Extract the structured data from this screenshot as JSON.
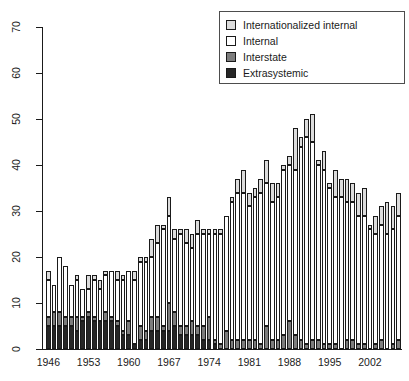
{
  "chart_data": {
    "type": "bar",
    "subtype": "stacked-bar",
    "title": "",
    "subtitle": "",
    "xlabel": "",
    "ylabel": "",
    "xlim": [
      1946,
      2007
    ],
    "ylim": [
      0,
      70
    ],
    "ytick_step": 10,
    "ytick_labels": [
      "0",
      "10",
      "20",
      "30",
      "40",
      "50",
      "60",
      "70"
    ],
    "ytick_values": [
      0,
      10,
      20,
      30,
      40,
      50,
      60,
      70
    ],
    "xtick_labels": [
      "1946",
      "1953",
      "1960",
      "1967",
      "1974",
      "1981",
      "1988",
      "1995",
      "2002"
    ],
    "xtick_values": [
      1946,
      1953,
      1960,
      1967,
      1974,
      1981,
      1988,
      1995,
      2002
    ],
    "grid": false,
    "legend_position": "top-right",
    "categories": [
      1946,
      1947,
      1948,
      1949,
      1950,
      1951,
      1952,
      1953,
      1954,
      1955,
      1956,
      1957,
      1958,
      1959,
      1960,
      1961,
      1962,
      1963,
      1964,
      1965,
      1966,
      1967,
      1968,
      1969,
      1970,
      1971,
      1972,
      1973,
      1974,
      1975,
      1976,
      1977,
      1978,
      1979,
      1980,
      1981,
      1982,
      1983,
      1984,
      1985,
      1986,
      1987,
      1988,
      1989,
      1990,
      1991,
      1992,
      1993,
      1994,
      1995,
      1996,
      1997,
      1998,
      1999,
      2000,
      2001,
      2002,
      2003,
      2004,
      2005,
      2006,
      2007
    ],
    "series": [
      {
        "name": "Extrasystemic",
        "color": "#262626",
        "values": [
          5,
          5,
          5,
          5,
          5,
          4,
          6,
          7,
          6,
          6,
          6,
          6,
          5,
          3,
          3,
          1,
          2,
          2,
          4,
          4,
          4,
          4,
          5,
          3,
          3,
          3,
          3,
          2,
          2,
          1,
          0,
          0,
          0,
          0,
          0,
          0,
          0,
          0,
          0,
          0,
          0,
          0,
          0,
          0,
          0,
          0,
          0,
          0,
          0,
          0,
          0,
          0,
          0,
          0,
          0,
          0,
          0,
          0,
          0,
          0,
          0,
          0
        ]
      },
      {
        "name": "Interstate",
        "color": "#7d7d7d",
        "values": [
          2,
          3,
          3,
          2,
          2,
          3,
          1,
          1,
          1,
          0,
          2,
          1,
          1,
          1,
          3,
          0,
          3,
          2,
          3,
          3,
          1,
          6,
          3,
          2,
          2,
          3,
          2,
          3,
          5,
          1,
          1,
          4,
          2,
          2,
          2,
          2,
          2,
          1,
          5,
          2,
          2,
          3,
          6,
          3,
          2,
          1,
          2,
          2,
          1,
          1,
          1,
          0,
          2,
          2,
          1,
          1,
          0,
          1,
          2,
          0,
          1,
          2
        ]
      },
      {
        "name": "Internal",
        "color": "#ffffff",
        "values": [
          8,
          6,
          12,
          11,
          7,
          8,
          6,
          5,
          8,
          7,
          8,
          10,
          9,
          11,
          11,
          14,
          14,
          15,
          13,
          16,
          21,
          19,
          16,
          20,
          18,
          16,
          20,
          20,
          18,
          23,
          24,
          25,
          30,
          32,
          32,
          29,
          31,
          33,
          31,
          30,
          31,
          36,
          34,
          36,
          42,
          45,
          43,
          38,
          38,
          34,
          32,
          33,
          30,
          30,
          28,
          28,
          26,
          24,
          25,
          25,
          25,
          27
        ]
      },
      {
        "name": "Internationalized internal",
        "color": "#dcdcdc",
        "values": [
          2,
          0,
          0,
          0,
          0,
          1,
          0,
          3,
          1,
          2,
          1,
          0,
          2,
          1,
          0,
          2,
          1,
          1,
          4,
          4,
          1,
          4,
          2,
          1,
          3,
          3,
          3,
          1,
          1,
          1,
          1,
          0,
          1,
          3,
          5,
          3,
          2,
          3,
          5,
          4,
          3,
          1,
          2,
          9,
          2,
          4,
          6,
          1,
          4,
          1,
          6,
          4,
          5,
          4,
          5,
          6,
          1,
          4,
          4,
          7,
          5,
          5
        ]
      }
    ],
    "totals": [
      17,
      14,
      20,
      18,
      14,
      16,
      13,
      16,
      16,
      15,
      17,
      17,
      17,
      16,
      17,
      17,
      20,
      20,
      24,
      27,
      27,
      33,
      26,
      26,
      26,
      25,
      28,
      26,
      26,
      26,
      26,
      29,
      33,
      37,
      39,
      34,
      35,
      37,
      41,
      36,
      36,
      40,
      42,
      48,
      46,
      50,
      51,
      41,
      43,
      36,
      39,
      37,
      37,
      36,
      34,
      35,
      27,
      29,
      31,
      32,
      31,
      34
    ]
  },
  "legend": {
    "items": [
      {
        "label": "Internationalized internal",
        "color": "#dcdcdc"
      },
      {
        "label": "Internal",
        "color": "#ffffff"
      },
      {
        "label": "Interstate",
        "color": "#7d7d7d"
      },
      {
        "label": "Extrasystemic",
        "color": "#262626"
      }
    ]
  },
  "axis": {
    "y_labels": [
      "70",
      "60",
      "50",
      "40",
      "30",
      "20",
      "10",
      "0"
    ],
    "x_labels": [
      "1946",
      "1953",
      "1960",
      "1967",
      "1974",
      "1981",
      "1988",
      "1995",
      "2002"
    ]
  }
}
